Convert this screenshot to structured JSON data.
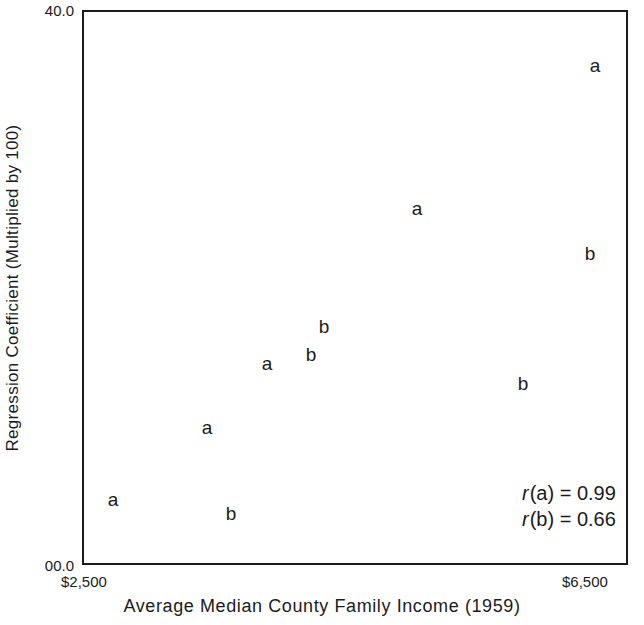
{
  "chart_data": {
    "type": "scatter",
    "title": "",
    "xlabel": "Average Median County Family Income (1959)",
    "ylabel": "Regression Coefficient (Multiplied by 100)",
    "xlim": [
      2500,
      6500
    ],
    "ylim": [
      0.0,
      40.0
    ],
    "xtick_labels": [
      "$2,500",
      "$6,500"
    ],
    "ytick_labels": [
      "40.0",
      "00.0"
    ],
    "grid": false,
    "legend": "none",
    "point_marker_style": "letter-label",
    "series": [
      {
        "name": "a",
        "marker_label": "a",
        "correlation": 0.99,
        "points": [
          {
            "label": "a",
            "x": 6243,
            "y": 36.2
          },
          {
            "label": "a",
            "x": 4940,
            "y": 25.9
          },
          {
            "label": "a",
            "x": 3040,
            "y": 14.7
          },
          {
            "label": "a",
            "x": 3341,
            "y": 10.1
          },
          {
            "label": "a",
            "x": 2712,
            "y": 4.9
          }
        ]
      },
      {
        "name": "b",
        "marker_label": "b",
        "correlation": 0.66,
        "points": [
          {
            "label": "b",
            "x": 6207,
            "y": 22.6
          },
          {
            "label": "b",
            "x": 5718,
            "y": 13.3
          },
          {
            "label": "b",
            "x": 4258,
            "y": 17.4
          },
          {
            "label": "b",
            "x": 4164,
            "y": 15.4
          },
          {
            "label": "b",
            "x": 3578,
            "y": 3.9
          }
        ]
      }
    ],
    "annotations": [
      {
        "symbol": "r",
        "group": "(a)",
        "equals": "=",
        "value": "0.99"
      },
      {
        "symbol": "r",
        "group": "(b)",
        "equals": "=",
        "value": "0.66"
      }
    ]
  },
  "axes": {
    "y_top_label": "40.0",
    "y_bottom_label": "00.0",
    "x_left_label": "$2,500",
    "x_right_label": "$6,500",
    "x_title": "Average Median County Family Income (1959)",
    "y_title": "Regression Coefficient (Multiplied by 100)",
    "frame_color": "#1b1b1b"
  },
  "points": [
    {
      "name": "point-a-1",
      "label": "a",
      "left": 593,
      "top": 63
    },
    {
      "name": "point-a-2",
      "label": "a",
      "left": 415,
      "top": 206
    },
    {
      "name": "point-a-3",
      "label": "a",
      "left": 265,
      "top": 361
    },
    {
      "name": "point-a-4",
      "label": "a",
      "left": 205,
      "top": 425
    },
    {
      "name": "point-a-5",
      "label": "a",
      "left": 111,
      "top": 497
    },
    {
      "name": "point-b-1",
      "label": "b",
      "left": 588,
      "top": 251
    },
    {
      "name": "point-b-2",
      "label": "b",
      "left": 322,
      "top": 324
    },
    {
      "name": "point-b-3",
      "label": "b",
      "left": 309,
      "top": 352
    },
    {
      "name": "point-b-4",
      "label": "b",
      "left": 521,
      "top": 381
    },
    {
      "name": "point-b-5",
      "label": "b",
      "left": 229,
      "top": 511
    }
  ],
  "annotation_text": {
    "line1_symbol": "r",
    "line1_rest": "(a) = 0.99",
    "line2_symbol": "r",
    "line2_rest": "(b) = 0.66"
  }
}
